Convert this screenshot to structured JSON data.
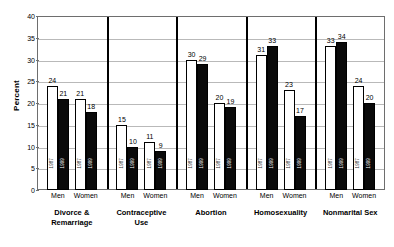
{
  "chart_data": {
    "type": "bar",
    "title": "",
    "subtitle": "",
    "xlabel": "",
    "ylabel": "Percent",
    "ylim": [
      0,
      40
    ],
    "ytick_step": 5,
    "yticks": [
      0,
      5,
      10,
      15,
      20,
      25,
      30,
      35,
      40
    ],
    "grid": true,
    "legend_position": "none",
    "series": [
      {
        "name": "1987",
        "values": [
          24,
          21,
          15,
          11,
          30,
          20,
          31,
          23,
          33,
          24
        ]
      },
      {
        "name": "1999",
        "values": [
          21,
          18,
          10,
          9,
          29,
          19,
          33,
          17,
          34,
          20
        ]
      }
    ],
    "categories": [
      "Divorce & Remarriage Men",
      "Divorce & Remarriage Women",
      "Contraceptive Use Men",
      "Contraceptive Use Women",
      "Abortion Men",
      "Abortion Women",
      "Homosexuality Men",
      "Homosexuality Women",
      "Nonmarital Sex Men",
      "Nonmarital Sex Women"
    ],
    "panels": [
      {
        "category": "Divorce & Remarriage",
        "category_line1": "Divorce &",
        "category_line2": "Remarriage",
        "groups": [
          {
            "gender": "Men",
            "bars": [
              {
                "year": "1987",
                "value": 24
              },
              {
                "year": "1999",
                "value": 21
              }
            ]
          },
          {
            "gender": "Women",
            "bars": [
              {
                "year": "1987",
                "value": 21
              },
              {
                "year": "1999",
                "value": 18
              }
            ]
          }
        ]
      },
      {
        "category": "Contraceptive Use",
        "category_line1": "Contraceptive",
        "category_line2": "Use",
        "groups": [
          {
            "gender": "Men",
            "bars": [
              {
                "year": "1987",
                "value": 15
              },
              {
                "year": "1999",
                "value": 10
              }
            ]
          },
          {
            "gender": "Women",
            "bars": [
              {
                "year": "1987",
                "value": 11
              },
              {
                "year": "1999",
                "value": 9
              }
            ]
          }
        ]
      },
      {
        "category": "Abortion",
        "category_line1": "Abortion",
        "category_line2": "",
        "groups": [
          {
            "gender": "Men",
            "bars": [
              {
                "year": "1987",
                "value": 30
              },
              {
                "year": "1999",
                "value": 29
              }
            ]
          },
          {
            "gender": "Women",
            "bars": [
              {
                "year": "1987",
                "value": 20
              },
              {
                "year": "1999",
                "value": 19
              }
            ]
          }
        ]
      },
      {
        "category": "Homosexuality",
        "category_line1": "Homosexuality",
        "category_line2": "",
        "groups": [
          {
            "gender": "Men",
            "bars": [
              {
                "year": "1987",
                "value": 31
              },
              {
                "year": "1999",
                "value": 33
              }
            ]
          },
          {
            "gender": "Women",
            "bars": [
              {
                "year": "1987",
                "value": 23
              },
              {
                "year": "1999",
                "value": 17
              }
            ]
          }
        ]
      },
      {
        "category": "Nonmarital Sex",
        "category_line1": "Nonmarital Sex",
        "category_line2": "",
        "groups": [
          {
            "gender": "Men",
            "bars": [
              {
                "year": "1987",
                "value": 33
              },
              {
                "year": "1999",
                "value": 34
              }
            ]
          },
          {
            "gender": "Women",
            "bars": [
              {
                "year": "1987",
                "value": 24
              },
              {
                "year": "1999",
                "value": 20
              }
            ]
          }
        ]
      }
    ],
    "colors": {
      "bar_1987_fill": "#ffffff",
      "bar_1999_fill": "#0a0a0a",
      "bar_outline": "#000000",
      "gridline": "#b9b9b9",
      "frame": "#6e6e6e",
      "panel_divider": "#000000",
      "text": "#000000",
      "background": "#ffffff"
    }
  }
}
